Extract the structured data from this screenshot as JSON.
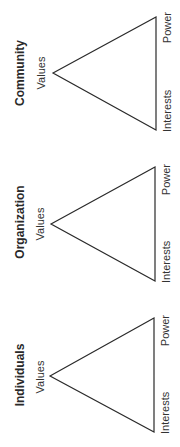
{
  "diagram": {
    "layout": "three stacked triangle diagrams, rotated 90 degrees clockwise",
    "colors": {
      "line": "#2a2a2a",
      "text": "#333333",
      "background": "#ffffff"
    },
    "panels": [
      {
        "title": "Community",
        "vertices": {
          "apex": "Values",
          "corner_top": "Power",
          "corner_bottom": "Interests"
        }
      },
      {
        "title": "Organization",
        "vertices": {
          "apex": "Values",
          "corner_top": "Power",
          "corner_bottom": "Interests"
        }
      },
      {
        "title": "Individuals",
        "vertices": {
          "apex": "Values",
          "corner_top": "Power",
          "corner_bottom": "Interests"
        }
      }
    ]
  }
}
